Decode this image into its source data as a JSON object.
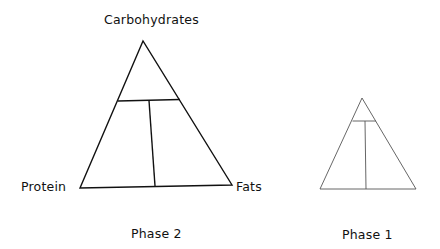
{
  "diagram": {
    "type": "macronutrient-triangles",
    "phase2": {
      "caption": "Phase 2",
      "vertex_labels": {
        "top": "Carbohydrates",
        "bottom_left": "Protein",
        "bottom_right": "Fats"
      },
      "stroke_color": "#111111"
    },
    "phase1": {
      "caption": "Phase 1",
      "stroke_color": "#555555"
    }
  }
}
